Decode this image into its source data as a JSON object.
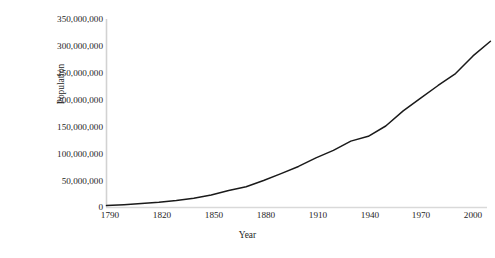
{
  "chart_data": {
    "type": "line",
    "title": "",
    "xlabel": "Year",
    "ylabel": "Population",
    "xlim": [
      1790,
      2010
    ],
    "ylim": [
      0,
      350000000
    ],
    "grid": false,
    "legend": "none",
    "line_color": "#1a1a1a",
    "axis_color": "#d0d0d0",
    "x_ticks": [
      "1790",
      "1820",
      "1850",
      "1880",
      "1910",
      "1940",
      "1970",
      "2000"
    ],
    "x_tick_values": [
      1790,
      1820,
      1850,
      1880,
      1910,
      1940,
      1970,
      2000
    ],
    "y_ticks": [
      "0",
      "50,000,000",
      "100,000,000",
      "150,000,000",
      "200,000,000",
      "250,000,000",
      "300,000,000",
      "350,000,000"
    ],
    "y_tick_values": [
      0,
      50000000,
      100000000,
      150000000,
      200000000,
      250000000,
      300000000,
      350000000
    ],
    "series": [
      {
        "name": "Population",
        "x": [
          1790,
          1800,
          1810,
          1820,
          1830,
          1840,
          1850,
          1860,
          1870,
          1880,
          1890,
          1900,
          1910,
          1920,
          1930,
          1940,
          1950,
          1960,
          1970,
          1980,
          1990,
          2000,
          2010
        ],
        "values": [
          3929214,
          5308483,
          7239881,
          9638453,
          12866020,
          17069453,
          23191876,
          31443321,
          38558371,
          50189209,
          62979766,
          76212168,
          92228496,
          106021537,
          123202624,
          132164569,
          151325798,
          179323175,
          203211926,
          226545805,
          248709873,
          281421906,
          308745538
        ]
      }
    ]
  }
}
